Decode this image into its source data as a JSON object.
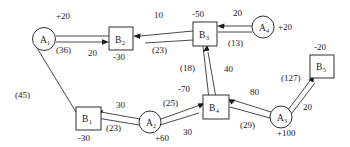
{
  "diagram": {
    "type": "network-flow",
    "nodes": [
      {
        "id": "A1",
        "label": "A",
        "sub": "1",
        "shape": "circle",
        "supply": "+20",
        "x": 44,
        "y": 39
      },
      {
        "id": "B2",
        "label": "B",
        "sub": "2",
        "shape": "box",
        "supply": "-30",
        "x": 121,
        "y": 39
      },
      {
        "id": "B3",
        "label": "B",
        "sub": "3",
        "shape": "box",
        "supply": "-50",
        "x": 205,
        "y": 34
      },
      {
        "id": "A4",
        "label": "A",
        "sub": "4",
        "shape": "circle",
        "supply": "+20",
        "x": 263,
        "y": 27
      },
      {
        "id": "B5",
        "label": "B",
        "sub": "5",
        "shape": "box",
        "supply": "-20",
        "x": 322,
        "y": 68
      },
      {
        "id": "B4",
        "label": "B",
        "sub": "4",
        "shape": "box",
        "supply": "-70",
        "x": 215,
        "y": 107
      },
      {
        "id": "A3",
        "label": "A",
        "sub": "3",
        "shape": "circle",
        "supply": "+100",
        "x": 281,
        "y": 117
      },
      {
        "id": "A2",
        "label": "A",
        "sub": "2",
        "shape": "circle",
        "supply": "+60",
        "x": 150,
        "y": 122
      },
      {
        "id": "B1",
        "label": "B",
        "sub": "1",
        "shape": "box",
        "supply": "-30",
        "x": 85,
        "y": 119
      }
    ],
    "edges": [
      {
        "from": "A1",
        "to": "B2",
        "cost": "(36)",
        "flow": "20",
        "arrow": "to"
      },
      {
        "from": "B3",
        "to": "B2",
        "cost": "(23)",
        "flow": "10",
        "arrow": "to"
      },
      {
        "from": "A4",
        "to": "B3",
        "cost": "(13)",
        "flow": "20",
        "arrow": "to"
      },
      {
        "from": "B4",
        "to": "B3",
        "cost": "(18)",
        "flow": "40",
        "arrow": "to"
      },
      {
        "from": "A1",
        "to": "B1",
        "cost": "(45)",
        "flow": "",
        "arrow": "none"
      },
      {
        "from": "A2",
        "to": "B1",
        "cost": "(23)",
        "flow": "30",
        "arrow": "to"
      },
      {
        "from": "A2",
        "to": "B4",
        "cost": "(25)",
        "flow": "30",
        "arrow": "to"
      },
      {
        "from": "A3",
        "to": "B4",
        "cost": "(29)",
        "flow": "80",
        "arrow": "to"
      },
      {
        "from": "A3",
        "to": "B5",
        "cost": "(127)",
        "flow": "20",
        "arrow": "to"
      }
    ],
    "labels": {
      "n_a1": "A",
      "n_a1_sub": "1",
      "s_a1": "+20",
      "n_b2": "B",
      "n_b2_sub": "2",
      "s_b2": "-30",
      "n_b3": "B",
      "n_b3_sub": "3",
      "s_b3": "-50",
      "n_a4": "A",
      "n_a4_sub": "4",
      "s_a4": "+20",
      "n_b5": "B",
      "n_b5_sub": "5",
      "s_b5": "-20",
      "n_b4": "B",
      "n_b4_sub": "4",
      "s_b4": "-70",
      "n_a3": "A",
      "n_a3_sub": "3",
      "s_a3": "+100",
      "n_a2": "A",
      "n_a2_sub": "2",
      "s_a2": "+60",
      "n_b1": "B",
      "n_b1_sub": "1",
      "s_b1": "-30",
      "c_a1_b2": "(36)",
      "f_a1_b2": "20",
      "c_b3_b2": "(23)",
      "f_b3_b2": "10",
      "c_a4_b3": "(13)",
      "f_a4_b3": "20",
      "c_b4_b3": "(18)",
      "f_b4_b3": "40",
      "c_a1_b1": "(45)",
      "c_a2_b1": "(23)",
      "f_a2_b1": "30",
      "c_a2_b4": "(25)",
      "f_a2_b4": "30",
      "c_a3_b4": "(29)",
      "f_a3_b4": "80",
      "c_a3_b5": "(127)",
      "f_a3_b5": "20"
    },
    "colors": {
      "stroke": "#1a1a1a",
      "fill": "#ffffff"
    }
  }
}
